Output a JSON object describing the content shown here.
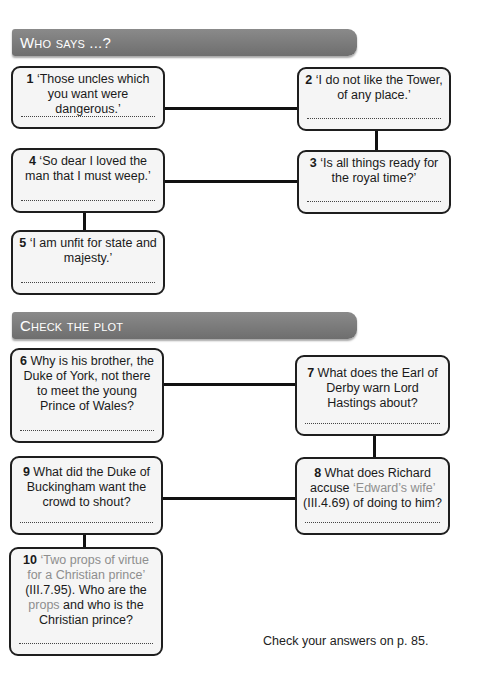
{
  "sections": [
    {
      "title": "Who says ...?",
      "questions": [
        {
          "num": "1",
          "text": "‘Those uncles which you want were dangerous.’"
        },
        {
          "num": "2",
          "text": "‘I do not like the Tower, of any place.’"
        },
        {
          "num": "3",
          "text": "‘Is all things ready for the royal time?’"
        },
        {
          "num": "4",
          "text": "‘So dear I loved the man that I must weep.’"
        },
        {
          "num": "5",
          "text": "‘I am unfit for state and majesty.’"
        }
      ]
    },
    {
      "title": "Check the plot",
      "questions": [
        {
          "num": "6",
          "text": "Why is his brother, the Duke of York, not there to meet the young Prince of Wales?"
        },
        {
          "num": "7",
          "text": "What does the Earl of Derby warn Lord Hastings about?"
        },
        {
          "num": "8",
          "text_before": "What does Richard accuse",
          "quote": "‘Edward’s wife’",
          "text_after": "(III.4.69) of doing to him?"
        },
        {
          "num": "9",
          "text": "What did the Duke of Buckingham want the crowd to shout?"
        },
        {
          "num": "10",
          "quote": "‘Two props of virtue for a Christian prince’",
          "text_mid": "(III.7.95). Who are the",
          "quote2": "props",
          "text_after": "and who is the Christian prince?"
        }
      ]
    }
  ],
  "footer": {
    "note": "Check your answers on p. 85."
  },
  "colors": {
    "header_bg": "#7c7c7c",
    "box_bg": "#f5f5f5",
    "box_border": "#1e1e1e",
    "quote_grey": "#8e8e8e"
  }
}
